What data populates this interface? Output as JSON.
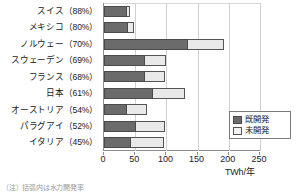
{
  "chart_data": {
    "type": "bar",
    "orientation": "horizontal",
    "stacked": true,
    "title": "",
    "xlabel": "TWh/年",
    "ylabel": "",
    "xlim": [
      0,
      250
    ],
    "xticks": [
      0,
      50,
      100,
      150,
      200,
      250
    ],
    "xtick_labels": [
      "0",
      "50",
      "100",
      "150",
      "200",
      "250"
    ],
    "grid": true,
    "legend_position": "bottom-right",
    "categories": [
      "スイス（88%）",
      "メキシコ（80%）",
      "ノルウェー（70%）",
      "スウェーデン（69%）",
      "フランス（68%）",
      "日本（61%）",
      "オーストリア（54%）",
      "パラグアイ（52%）",
      "イタリア（45%）"
    ],
    "country_names": [
      "スイス",
      "メキシコ",
      "ノルウェー",
      "スウェーデン",
      "フランス",
      "日本",
      "オーストリア",
      "パラグアイ",
      "イタリア"
    ],
    "development_rates_percent": [
      88,
      80,
      70,
      69,
      68,
      61,
      54,
      52,
      45
    ],
    "series": [
      {
        "name": "既開発",
        "values": [
          37,
          38,
          135,
          66,
          66,
          79,
          37,
          51,
          43
        ]
      },
      {
        "name": "未開発",
        "values": [
          5,
          10,
          58,
          33,
          31,
          51,
          32,
          47,
          53
        ]
      }
    ],
    "totals": [
      42,
      48,
      193,
      99,
      97,
      130,
      69,
      98,
      96
    ]
  },
  "legend": {
    "items": [
      {
        "label": "既開発",
        "swatch": "dark-gray"
      },
      {
        "label": "未開発",
        "swatch": "light-gray"
      }
    ]
  },
  "axis": {
    "unit_label": "TWh/年"
  },
  "footnote": {
    "text": "（注）括弧内は水力開発率"
  },
  "colors": {
    "developed": "#6b6b6b",
    "undeveloped": "#e9e9e9",
    "axis": "#8c8c8c",
    "grid": "#d0d0d0",
    "text": "#1a1a1a"
  }
}
